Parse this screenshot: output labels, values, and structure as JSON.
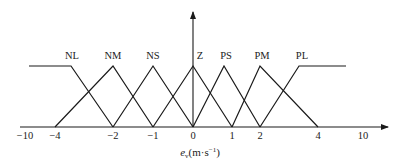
{
  "chart_data": {
    "type": "line",
    "title": "",
    "xlabel": "e_v(m·s⁻¹)",
    "xlabel_parts": {
      "base": "e",
      "sub": "v",
      "unit_open": "(m·s",
      "sup": "−1",
      "unit_close": ")"
    },
    "ylabel": "",
    "grid": false,
    "legend": "inline labels above peaks",
    "x_ticks": [
      {
        "value": -10,
        "label": "−10",
        "px": 25
      },
      {
        "value": -4,
        "label": "−4",
        "px": 55
      },
      {
        "value": -2,
        "label": "−2",
        "px": 113
      },
      {
        "value": -1,
        "label": "−1",
        "px": 153
      },
      {
        "value": 0,
        "label": "0",
        "px": 193
      },
      {
        "value": 1,
        "label": "1",
        "px": 232
      },
      {
        "value": 2,
        "label": "2",
        "px": 260
      },
      {
        "value": 4,
        "label": "4",
        "px": 318
      },
      {
        "value": 10,
        "label": "10",
        "px": 363
      }
    ],
    "series": [
      {
        "name": "NL",
        "shape": "left-shoulder",
        "points": [
          [
            -10,
            1
          ],
          [
            -3.5,
            1
          ],
          [
            -2,
            0
          ]
        ]
      },
      {
        "name": "NM",
        "shape": "triangle",
        "points": [
          [
            -4,
            0
          ],
          [
            -2,
            1
          ],
          [
            -1,
            0
          ]
        ]
      },
      {
        "name": "NS",
        "shape": "triangle",
        "points": [
          [
            -2,
            0
          ],
          [
            -1,
            1
          ],
          [
            0,
            0
          ]
        ]
      },
      {
        "name": "Z",
        "shape": "triangle",
        "points": [
          [
            -1,
            0
          ],
          [
            0,
            1
          ],
          [
            1,
            0
          ]
        ]
      },
      {
        "name": "PS",
        "shape": "triangle",
        "points": [
          [
            0,
            0
          ],
          [
            1,
            1
          ],
          [
            2,
            0
          ]
        ]
      },
      {
        "name": "PM",
        "shape": "triangle",
        "points": [
          [
            1,
            0
          ],
          [
            2,
            1
          ],
          [
            4,
            0
          ]
        ]
      },
      {
        "name": "PL",
        "shape": "right-shoulder",
        "points": [
          [
            2,
            0
          ],
          [
            3.5,
            1
          ],
          [
            10,
            1
          ]
        ]
      }
    ],
    "ylim": [
      0,
      1
    ]
  },
  "render": {
    "axis_y": 127,
    "peak_y": 66,
    "axis_x_start": 20,
    "axis_x_end": 388,
    "vaxis_x": 193,
    "vaxis_top": 12,
    "line_color": "#1a1a1a",
    "polylines": [
      {
        "name": "NL",
        "points": "29,66 71,66 113,127",
        "label_x": 72
      },
      {
        "name": "NM",
        "points": "55,127 113,66 153,127",
        "label_x": 113
      },
      {
        "name": "NS",
        "points": "113,127 153,66 193,127",
        "label_x": 153
      },
      {
        "name": "Z",
        "points": "153,127 193,66 232,127",
        "label_x": 200
      },
      {
        "name": "PS",
        "points": "193,127 224,66 260,127",
        "label_x": 226
      },
      {
        "name": "PM",
        "points": "232,127 260,66 318,127",
        "label_x": 262
      },
      {
        "name": "PL",
        "points": "260,127 299,66 346,66",
        "label_x": 302
      }
    ]
  }
}
